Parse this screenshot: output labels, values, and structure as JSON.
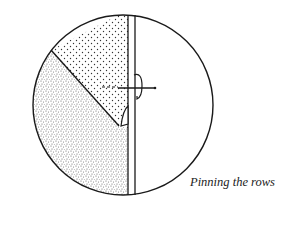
{
  "figure": {
    "caption": "Pinning the rows",
    "colors": {
      "line": "#1a1a1a",
      "background": "#ffffff",
      "sparse_dots": "#333333",
      "dense_dots": "#555555"
    },
    "parts": [
      {
        "name": "outer-circle",
        "description": "circular frame of the illustration"
      },
      {
        "name": "upper-panel",
        "description": "upper-left region with sparse dot pattern"
      },
      {
        "name": "lower-panel",
        "description": "lower-left region with dense speckle pattern"
      },
      {
        "name": "vertical-strip",
        "description": "narrow vertical double-line band"
      },
      {
        "name": "pins",
        "description": "two pins fastening the rows"
      }
    ]
  }
}
